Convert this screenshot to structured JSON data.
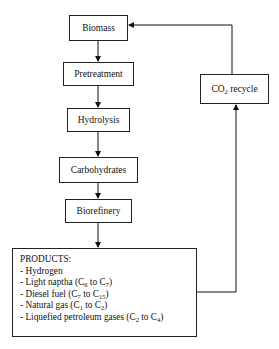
{
  "diagram": {
    "type": "flowchart",
    "nodes": {
      "biomass": "Biomass",
      "pretreatment": "Pretreatment",
      "hydrolysis": "Hydrolysis",
      "carbohydrates": "Carbohydrates",
      "biorefinery": "Biorefinery",
      "co2_recycle": {
        "prefix": "CO",
        "sub": "2",
        "suffix": " recycle"
      }
    },
    "products": {
      "title": "PRODUCTS:",
      "items": [
        {
          "text": "- Hydrogen"
        },
        {
          "text": "- Light naptha (C",
          "sub1": "6",
          "mid": " to C",
          "sub2": "7",
          "end": ")"
        },
        {
          "text": "- Diesel fuel (C",
          "sub1": "7",
          "mid": " to C",
          "sub2": "15",
          "end": ")"
        },
        {
          "text": "- Natural gas (C",
          "sub1": "1",
          "mid": " to C",
          "sub2": "2",
          "end": ")"
        },
        {
          "text": "- Liquefied petroleum gases (C",
          "sub1": "2",
          "mid": " to C",
          "sub2": "4",
          "end": ")"
        }
      ]
    },
    "edges": [
      [
        "Biomass",
        "Pretreatment"
      ],
      [
        "Pretreatment",
        "Hydrolysis"
      ],
      [
        "Hydrolysis",
        "Carbohydrates"
      ],
      [
        "Carbohydrates",
        "Biorefinery"
      ],
      [
        "Biorefinery",
        "PRODUCTS"
      ],
      [
        "PRODUCTS",
        "CO2 recycle"
      ],
      [
        "CO2 recycle",
        "Biomass"
      ]
    ]
  }
}
